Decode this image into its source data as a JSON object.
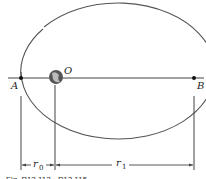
{
  "diagram": {
    "type": "elliptical-orbit",
    "labels": {
      "center": "O",
      "perigee": "A",
      "apogee": "B",
      "r0_main": "r",
      "r0_sub": "0",
      "r1_main": "r",
      "r1_sub": "1"
    },
    "caption": "Fig. P13.113 - P13.115"
  }
}
